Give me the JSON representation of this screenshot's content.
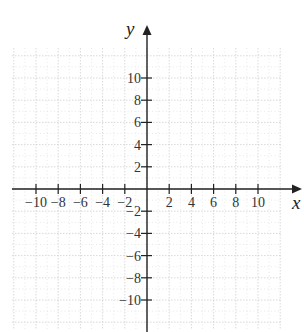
{
  "diagram": {
    "type": "coordinate-plane",
    "x_axis": {
      "label": "x",
      "ticks": [
        -10,
        -8,
        -6,
        -4,
        -2,
        2,
        4,
        6,
        8,
        10
      ],
      "tick_labels": [
        "−10",
        "−8",
        "−6",
        "−4",
        "−2",
        "2",
        "4",
        "6",
        "8",
        "10"
      ]
    },
    "y_axis": {
      "label": "y",
      "ticks": [
        10,
        8,
        6,
        4,
        2,
        -2,
        -4,
        -6,
        -8,
        -10
      ],
      "tick_labels": [
        "10",
        "8",
        "6",
        "4",
        "2",
        "−2",
        "−4",
        "−6",
        "−8",
        "−10"
      ]
    },
    "grid": {
      "visible": true,
      "style": "dotted",
      "minor_step": 2,
      "major_step": 4,
      "range": [
        -12,
        12
      ]
    },
    "colors": {
      "axis": "#222222",
      "grid_minor": "#e2e2e2",
      "grid_major": "#cfcfcf",
      "text": "#333333"
    }
  }
}
